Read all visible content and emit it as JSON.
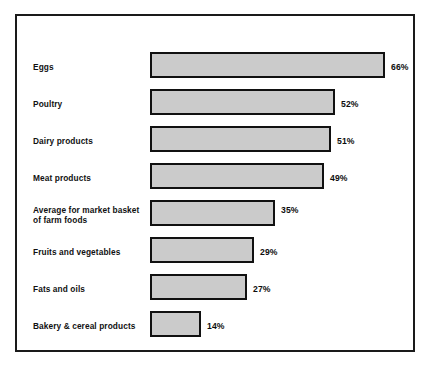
{
  "chart_data": {
    "type": "bar",
    "orientation": "horizontal",
    "title": "",
    "subtitle": "",
    "xlabel": "",
    "ylabel": "",
    "xlim": [
      0,
      66
    ],
    "grid": false,
    "legend": null,
    "value_suffix": "%",
    "categories": [
      "Eggs",
      "Poultry",
      "Dairy products",
      "Meat products",
      "Average for market basket\nof farm foods",
      "Fruits and vegetables",
      "Fats and oils",
      "Bakery & cereal products"
    ],
    "values": [
      66,
      52,
      51,
      49,
      35,
      29,
      27,
      14
    ],
    "value_labels": [
      "66%",
      "52%",
      "51%",
      "49%",
      "35%",
      "29%",
      "27%",
      "14%"
    ],
    "colors": {
      "bar_fill": "#cbcbcb",
      "bar_border": "#111111",
      "frame": "#1a1a1a",
      "background": "#ffffff",
      "text": "#111111"
    }
  },
  "rows": [
    {
      "label": "Eggs",
      "value_label": "66%",
      "bar_width": 235,
      "top": 52,
      "label_top": 62,
      "value_left": 391
    },
    {
      "label": "Poultry",
      "value_label": "52%",
      "bar_width": 185,
      "top": 89,
      "label_top": 99,
      "value_left": 341
    },
    {
      "label": "Dairy products",
      "value_label": "51%",
      "bar_width": 181,
      "top": 126,
      "label_top": 136,
      "value_left": 337
    },
    {
      "label": "Meat products",
      "value_label": "49%",
      "bar_width": 174,
      "top": 163,
      "label_top": 173,
      "value_left": 330
    },
    {
      "label": "Average for market basket\nof farm foods",
      "value_label": "35%",
      "bar_width": 125,
      "top": 200,
      "label_top": 205,
      "value_left": 281
    },
    {
      "label": "Fruits and vegetables",
      "value_label": "29%",
      "bar_width": 104,
      "top": 237,
      "label_top": 247,
      "value_left": 260
    },
    {
      "label": "Fats and oils",
      "value_label": "27%",
      "bar_width": 97,
      "top": 274,
      "label_top": 284,
      "value_left": 253
    },
    {
      "label": "Bakery & cereal products",
      "value_label": "14%",
      "bar_width": 51,
      "top": 311,
      "label_top": 321,
      "value_left": 207
    }
  ]
}
